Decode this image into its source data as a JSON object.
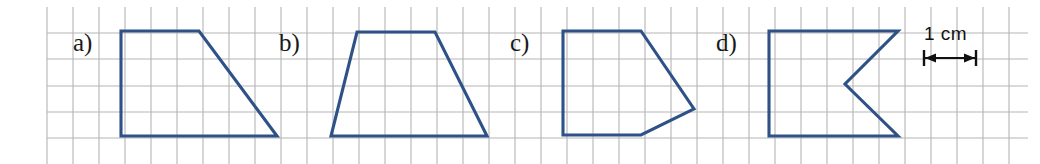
{
  "figure": {
    "background_color": "#ffffff",
    "width": 1040,
    "height": 164,
    "grid": {
      "cell_px": 26,
      "line_color": "#b5b5b5",
      "line_width": 1.1,
      "x_start": 47,
      "x_end": 1028,
      "y_start": 7,
      "y_end": 164,
      "h_line_y": [
        33,
        59,
        86,
        112,
        138
      ],
      "v_line_x": [
        47,
        73,
        99,
        125,
        151,
        177,
        203,
        229,
        255,
        281,
        307,
        333,
        359,
        385,
        411,
        437,
        463,
        489,
        515,
        541,
        567,
        593,
        619,
        645,
        671,
        697,
        723,
        749,
        775,
        801,
        827,
        853,
        879,
        905,
        931,
        957,
        983,
        1009
      ]
    },
    "shape_color": "#2e5288",
    "shape_stroke_width": 3.1,
    "panels": [
      {
        "id": "a",
        "label": "a)",
        "shape_name": "right-trapezoid",
        "vertices": [
          [
            121,
            31
          ],
          [
            199,
            31
          ],
          [
            277,
            136
          ],
          [
            121,
            136
          ]
        ]
      },
      {
        "id": "b",
        "label": "b)",
        "shape_name": "isosceles-trapezoid",
        "vertices": [
          [
            357,
            32
          ],
          [
            435,
            32
          ],
          [
            487,
            136
          ],
          [
            331,
            136
          ]
        ]
      },
      {
        "id": "c",
        "label": "c)",
        "shape_name": "pentagon",
        "vertices": [
          [
            563,
            31
          ],
          [
            641,
            31
          ],
          [
            694,
            109
          ],
          [
            641,
            135
          ],
          [
            563,
            135
          ]
        ]
      },
      {
        "id": "d",
        "label": "d)",
        "shape_name": "concave-chevron-flag",
        "vertices": [
          [
            769,
            31
          ],
          [
            898,
            31
          ],
          [
            845,
            84
          ],
          [
            898,
            136
          ],
          [
            769,
            136
          ]
        ]
      }
    ],
    "scale": {
      "label": "1 cm",
      "arrow_color": "#111111",
      "arrow_y": 58,
      "arrow_x_start": 924,
      "arrow_x_end": 976,
      "tick_half_height": 8,
      "arrow_stroke_width": 2,
      "cells_spanned": 2
    }
  }
}
